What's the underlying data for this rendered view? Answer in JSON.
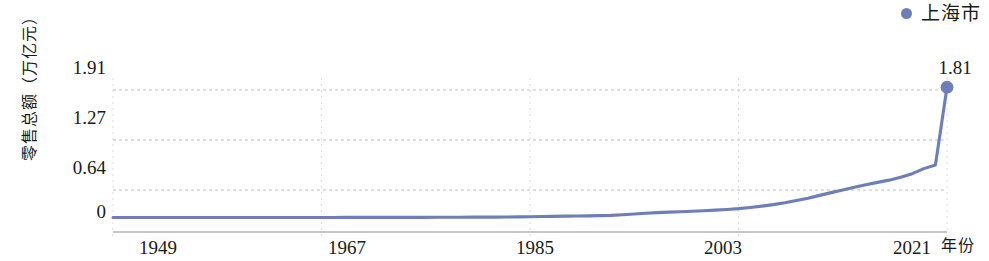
{
  "legend": {
    "position": "top-right",
    "entries": [
      {
        "label": "上海市",
        "color": "#6e7eb8",
        "marker": "circle"
      }
    ]
  },
  "axes": {
    "y_title": "零售总额（万亿元）",
    "x_title": "年份"
  },
  "annotations": {
    "last_point_label": "1.81"
  },
  "chart_data": {
    "type": "line",
    "title": "",
    "subtitle": "",
    "xlabel": "年份",
    "ylabel": "零售总额（万亿元）",
    "grid": true,
    "legend_position": "top-right",
    "xlim": [
      1949,
      2021
    ],
    "ylim": [
      -0.2,
      1.91
    ],
    "xticks": [
      1949,
      1967,
      1985,
      2003,
      2021
    ],
    "xticklabels": [
      "1949",
      "1967",
      "1985",
      "2003",
      "2021"
    ],
    "yticks": [
      0,
      0.64,
      1.27,
      1.91
    ],
    "yticklabels": [
      "0",
      "0.64",
      "1.27",
      "1.91"
    ],
    "series": [
      {
        "name": "上海市",
        "color": "#6e7eb8",
        "end_label": "1.81",
        "x": [
          1949,
          1950,
          1951,
          1952,
          1953,
          1954,
          1955,
          1956,
          1957,
          1958,
          1959,
          1960,
          1961,
          1962,
          1963,
          1964,
          1965,
          1966,
          1967,
          1968,
          1969,
          1970,
          1971,
          1972,
          1973,
          1974,
          1975,
          1976,
          1977,
          1978,
          1979,
          1980,
          1981,
          1982,
          1983,
          1984,
          1985,
          1986,
          1987,
          1988,
          1989,
          1990,
          1991,
          1992,
          1993,
          1994,
          1995,
          1996,
          1997,
          1998,
          1999,
          2000,
          2001,
          2002,
          2003,
          2004,
          2005,
          2006,
          2007,
          2008,
          2009,
          2010,
          2011,
          2012,
          2013,
          2014,
          2015,
          2016,
          2017,
          2018,
          2019,
          2020,
          2021
        ],
        "values": [
          0.0005,
          0.0006,
          0.0008,
          0.0009,
          0.0011,
          0.0012,
          0.0012,
          0.0014,
          0.0014,
          0.0016,
          0.0018,
          0.002,
          0.0019,
          0.0018,
          0.0019,
          0.002,
          0.0022,
          0.0023,
          0.0023,
          0.0023,
          0.0024,
          0.0026,
          0.0028,
          0.003,
          0.0032,
          0.0033,
          0.0035,
          0.0036,
          0.0039,
          0.0043,
          0.0051,
          0.0059,
          0.0066,
          0.0071,
          0.0079,
          0.0098,
          0.0123,
          0.0145,
          0.0166,
          0.0208,
          0.0222,
          0.0236,
          0.0268,
          0.0312,
          0.0396,
          0.0501,
          0.0604,
          0.0688,
          0.0753,
          0.081,
          0.0874,
          0.0952,
          0.1037,
          0.1133,
          0.1244,
          0.1412,
          0.1591,
          0.18,
          0.2065,
          0.2373,
          0.2695,
          0.3083,
          0.3465,
          0.3846,
          0.4207,
          0.4573,
          0.4888,
          0.52,
          0.56,
          0.61,
          0.68,
          0.73,
          1.81
        ]
      }
    ]
  }
}
